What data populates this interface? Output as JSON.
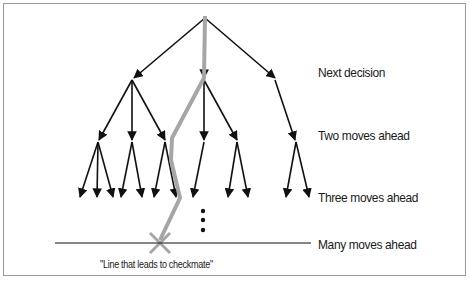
{
  "diagram": {
    "type": "game-tree",
    "levels": [
      {
        "label": "Next decision"
      },
      {
        "label": "Two moves ahead"
      },
      {
        "label": "Three moves ahead"
      },
      {
        "label": "Many moves ahead"
      }
    ],
    "caption": "\"Line that leads to checkmate\"",
    "colors": {
      "edge": "#111111",
      "highlight_path": "#a6a6a6",
      "frame": "#9a9a9a"
    }
  }
}
